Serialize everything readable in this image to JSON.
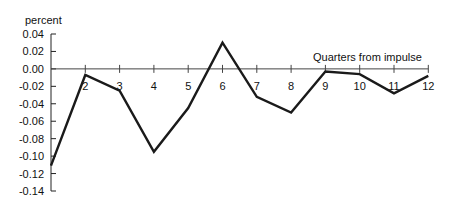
{
  "chart_data": {
    "type": "line",
    "title": "",
    "xlabel": "Quarters from impulse",
    "ylabel": "percent",
    "x": [
      1,
      2,
      3,
      4,
      5,
      6,
      7,
      8,
      9,
      10,
      11,
      12
    ],
    "x_tick_labels": [
      "2",
      "3",
      "4",
      "5",
      "6",
      "7",
      "8",
      "9",
      "10",
      "11",
      "12"
    ],
    "y_tick_labels": [
      "0.04",
      "0.02",
      "0.00",
      "-0.02",
      "-0.04",
      "-0.06",
      "-0.08",
      "-0.10",
      "-0.12",
      "-0.14"
    ],
    "y_ticks": [
      0.04,
      0.02,
      0.0,
      -0.02,
      -0.04,
      -0.06,
      -0.08,
      -0.1,
      -0.12,
      -0.14
    ],
    "ylim": [
      -0.14,
      0.04
    ],
    "xlim": [
      1,
      12
    ],
    "grid": false,
    "legend": null,
    "series": [
      {
        "name": "response",
        "values": [
          -0.111,
          -0.007,
          -0.025,
          -0.095,
          -0.045,
          0.03,
          -0.032,
          -0.05,
          -0.003,
          -0.006,
          -0.028,
          -0.008
        ],
        "color": "#1a1a1a"
      }
    ]
  }
}
